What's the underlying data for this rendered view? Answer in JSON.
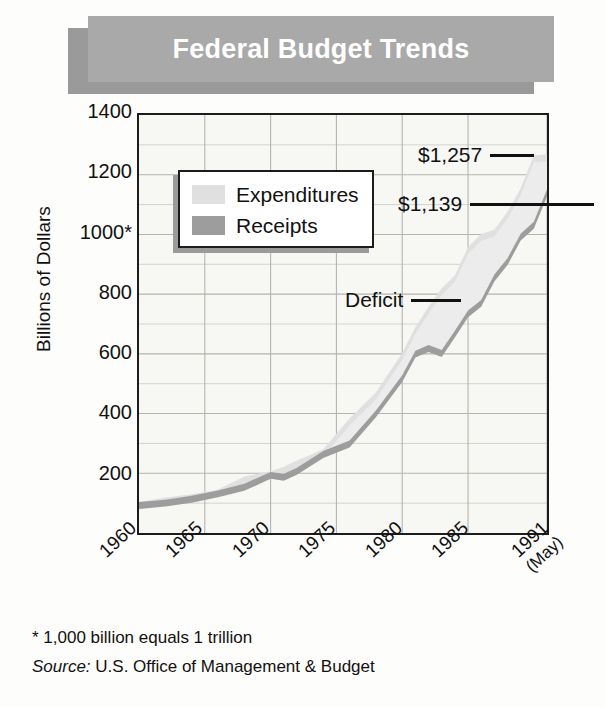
{
  "title": "Federal Budget Trends",
  "legend": {
    "items": [
      {
        "label": "Expenditures",
        "color": "#e0e0e0"
      },
      {
        "label": "Receipts",
        "color": "#9d9d9d"
      }
    ]
  },
  "annotations": [
    {
      "name": "expenditures-1991-value",
      "text": "$1,257"
    },
    {
      "name": "receipts-1991-value",
      "text": "$1,139"
    },
    {
      "name": "deficit-label",
      "text": "Deficit"
    }
  ],
  "footnotes": {
    "asterisk": "* 1,000 billion equals 1 trillion",
    "source_label": "Source:",
    "source_text": " U.S. Office of Management & Budget"
  },
  "chart_data": {
    "type": "area",
    "title": "Federal Budget Trends",
    "xlabel": "",
    "ylabel": "Billions of Dollars",
    "xlim": [
      1960,
      1991
    ],
    "ylim": [
      0,
      1400
    ],
    "ytick_labels": [
      "1400",
      "1200",
      "1000*",
      "800",
      "600",
      "400",
      "200"
    ],
    "ytick_values": [
      1400,
      1200,
      1000,
      800,
      600,
      400,
      200
    ],
    "xtick_labels": [
      "1960",
      "1965",
      "1970",
      "1975",
      "1980",
      "1985",
      "1991"
    ],
    "xtick_sublabels": [
      "",
      "",
      "",
      "",
      "",
      "",
      "(May)"
    ],
    "xtick_values": [
      1960,
      1965,
      1970,
      1975,
      1980,
      1985,
      1991
    ],
    "grid": true,
    "grid_minor_step": 100,
    "legend_position": "upper-left-inside",
    "x": [
      1960,
      1962,
      1964,
      1966,
      1968,
      1970,
      1971,
      1972,
      1974,
      1976,
      1978,
      1980,
      1981,
      1982,
      1983,
      1984,
      1985,
      1986,
      1987,
      1988,
      1989,
      1990,
      1991
    ],
    "series": [
      {
        "name": "Expenditures",
        "color": "#e0e0e0",
        "values": [
          92,
          107,
          118,
          134,
          178,
          195,
          210,
          231,
          269,
          372,
          459,
          591,
          678,
          746,
          808,
          852,
          946,
          990,
          1004,
          1064,
          1143,
          1253,
          1257
        ]
      },
      {
        "name": "Receipts",
        "color": "#9d9d9d",
        "values": [
          92,
          100,
          113,
          131,
          153,
          193,
          187,
          207,
          263,
          298,
          399,
          517,
          599,
          618,
          601,
          666,
          734,
          769,
          854,
          909,
          991,
          1031,
          1139
        ]
      }
    ],
    "end_labels": {
      "Expenditures": "$1,257",
      "Receipts": "$1,139"
    },
    "annotation_labels": [
      "Deficit"
    ]
  }
}
